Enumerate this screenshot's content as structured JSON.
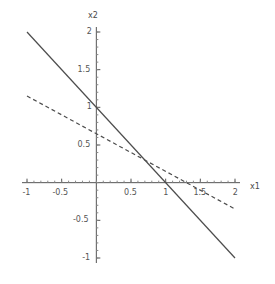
{
  "chart_data": {
    "type": "line",
    "title": "",
    "subtitle": "",
    "xlabel": "x1",
    "ylabel": "x2",
    "xlim": [
      -1,
      2
    ],
    "ylim": [
      -1,
      2
    ],
    "grid": false,
    "legend": "none",
    "axis_style": "crossed-at-origin",
    "xticks": [
      -1,
      -0.5,
      0.5,
      1,
      1.5,
      2
    ],
    "xtick_labels": [
      "-1",
      "-0.5",
      "0.5",
      "1",
      "1.5",
      "2"
    ],
    "yticks": [
      -1,
      -0.5,
      0.5,
      1,
      1.5,
      2
    ],
    "ytick_labels": [
      "-1",
      "-0.5",
      "0.5",
      "1",
      "1.5",
      "2"
    ],
    "series": [
      {
        "name": "solid-line",
        "style": "solid",
        "color": "#4d4d4d",
        "slope": -1,
        "intercept": 1,
        "equation": "x2 = 1 - x1",
        "x": [
          -1,
          2
        ],
        "values": [
          2,
          -1
        ],
        "x_intercept": 1,
        "y_intercept": 1
      },
      {
        "name": "dashed-line",
        "style": "dashed",
        "color": "#4d4d4d",
        "slope": -0.5,
        "intercept": 0.65,
        "equation": "x2 = 0.65 - 0.5 x1",
        "x": [
          -1,
          2
        ],
        "values": [
          1.15,
          -0.35
        ],
        "x_intercept": 1.3,
        "y_intercept": 0.65
      }
    ],
    "intersection": {
      "x": 0.7,
      "y": 0.3
    }
  },
  "labels": {
    "x_axis": "x1",
    "y_axis": "x2"
  }
}
